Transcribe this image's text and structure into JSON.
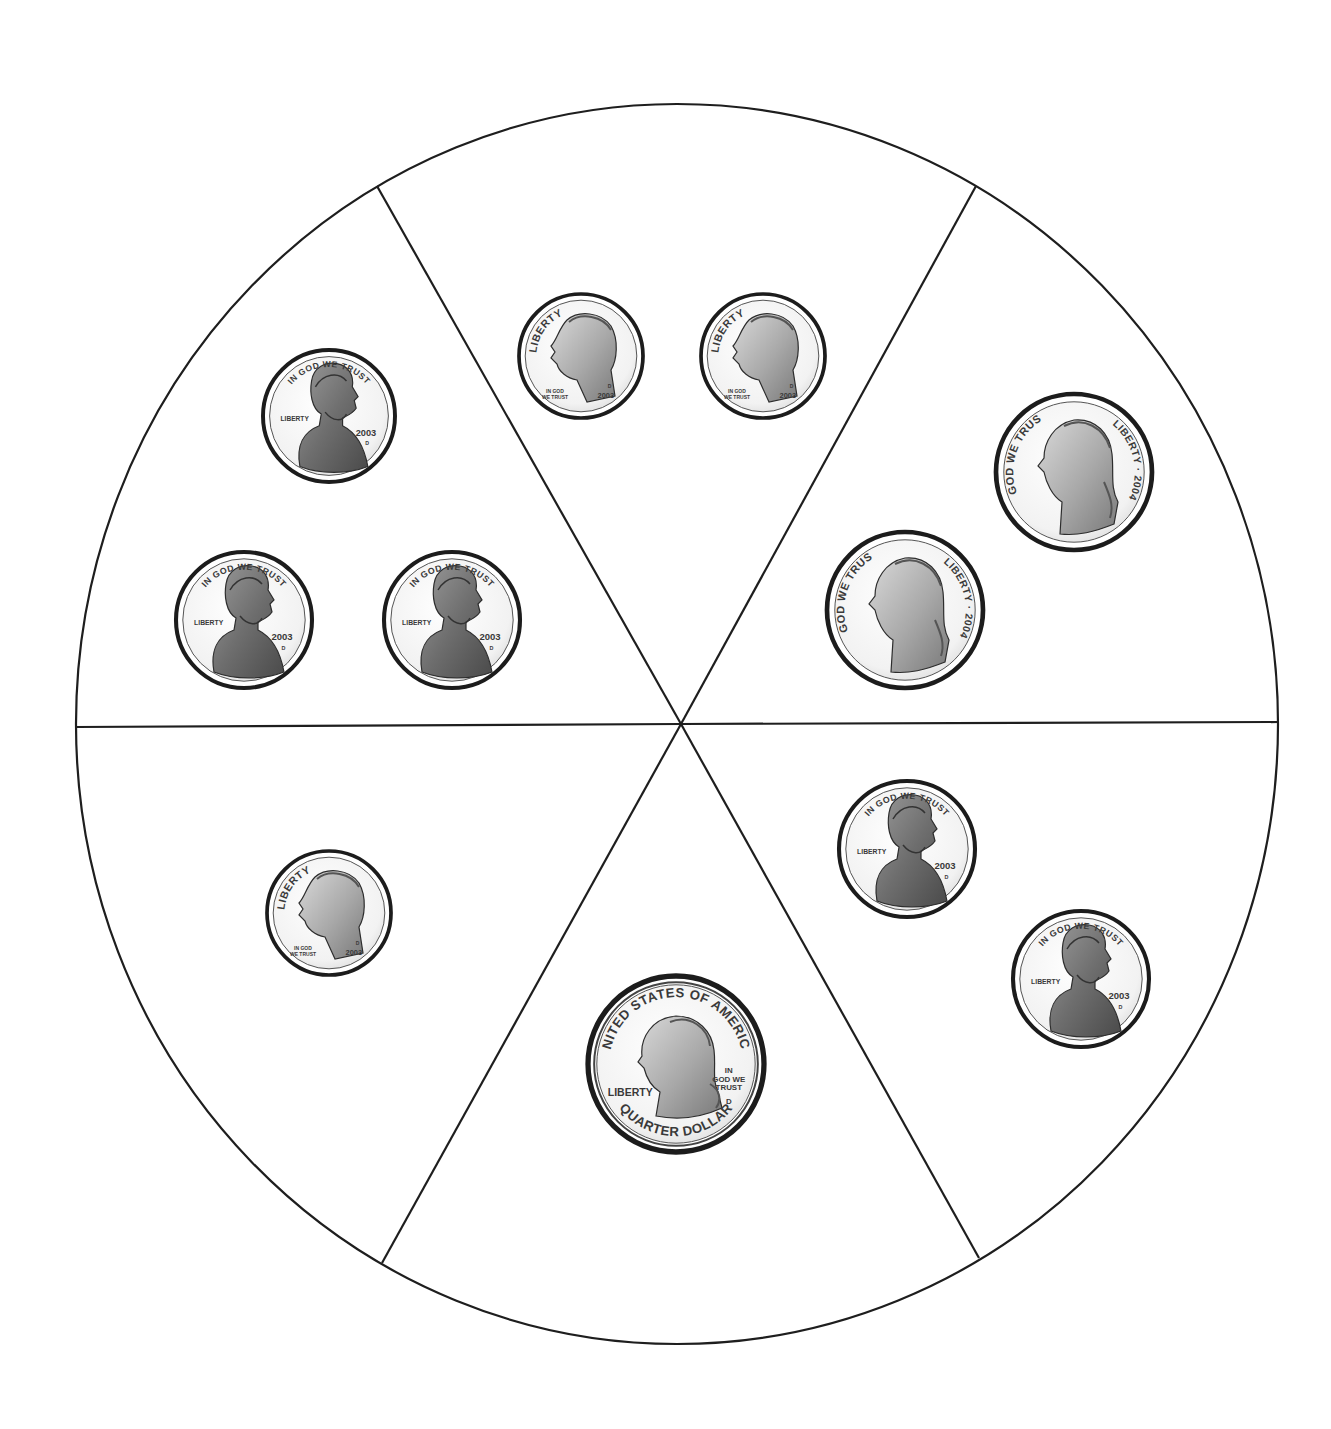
{
  "diagram": {
    "type": "coin-sorting-wheel",
    "outline_color": "#1e1e1e",
    "background_color": "#ffffff",
    "sections": [
      {
        "id": "upper-left",
        "coins": [
          {
            "kind": "penny",
            "cx": 329,
            "cy": 416,
            "r": 66,
            "top_text": "IN GOD WE TRUST",
            "left_text": "LIBERTY",
            "year": "2003",
            "mint": "D"
          },
          {
            "kind": "penny",
            "cx": 244,
            "cy": 620,
            "r": 68,
            "top_text": "IN GOD WE TRUST",
            "left_text": "LIBERTY",
            "year": "2003",
            "mint": "D"
          },
          {
            "kind": "penny",
            "cx": 452,
            "cy": 620,
            "r": 68,
            "top_text": "IN GOD WE TRUST",
            "left_text": "LIBERTY",
            "year": "2003",
            "mint": "D"
          }
        ]
      },
      {
        "id": "top",
        "coins": [
          {
            "kind": "dime",
            "cx": 581,
            "cy": 356,
            "r": 62,
            "arc_text": "LIBERTY",
            "motto": "IN GOD WE TRUST",
            "year": "2003",
            "mint": "D"
          },
          {
            "kind": "dime",
            "cx": 763,
            "cy": 356,
            "r": 62,
            "arc_text": "LIBERTY",
            "motto": "IN GOD WE TRUST",
            "year": "2003",
            "mint": "D"
          }
        ]
      },
      {
        "id": "upper-right",
        "coins": [
          {
            "kind": "nickel",
            "cx": 1074,
            "cy": 472,
            "r": 78,
            "left_text": "IN GOD WE TRUST",
            "right_text": "LIBERTY · 2004"
          },
          {
            "kind": "nickel",
            "cx": 905,
            "cy": 610,
            "r": 78,
            "left_text": "IN GOD WE TRUST",
            "right_text": "LIBERTY · 2004"
          }
        ]
      },
      {
        "id": "lower-left",
        "coins": [
          {
            "kind": "dime",
            "cx": 329,
            "cy": 913,
            "r": 62,
            "arc_text": "LIBERTY",
            "motto": "IN GOD WE TRUST",
            "year": "2003",
            "mint": "D"
          }
        ]
      },
      {
        "id": "bottom",
        "coins": [
          {
            "kind": "quarter",
            "cx": 676,
            "cy": 1064,
            "r": 88,
            "top_text": "UNITED STATES OF AMERICA",
            "bottom_text": "QUARTER DOLLAR",
            "left_text": "LIBERTY",
            "motto": "IN GOD WE TRUST",
            "mint": "D"
          }
        ]
      },
      {
        "id": "lower-right",
        "coins": [
          {
            "kind": "penny",
            "cx": 907,
            "cy": 849,
            "r": 68,
            "top_text": "IN GOD WE TRUST",
            "left_text": "LIBERTY",
            "year": "2003",
            "mint": "D"
          },
          {
            "kind": "penny",
            "cx": 1081,
            "cy": 979,
            "r": 68,
            "top_text": "IN GOD WE TRUST",
            "left_text": "LIBERTY",
            "year": "2003",
            "mint": "D"
          }
        ]
      }
    ]
  }
}
